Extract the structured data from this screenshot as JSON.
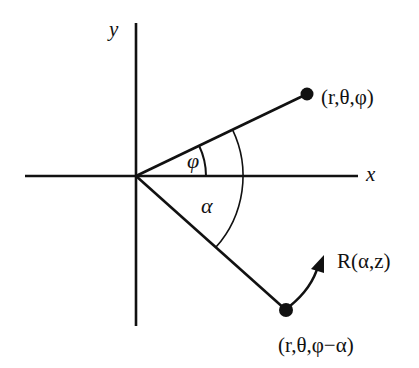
{
  "diagram": {
    "title": "",
    "axes": {
      "x_label": "x",
      "y_label": "y"
    },
    "angles": {
      "phi_label": "φ",
      "alpha_label": "α"
    },
    "points": [
      {
        "id": "original",
        "label": "(r,θ,φ)"
      },
      {
        "id": "rotated",
        "label": "(r,θ,φ−α)"
      }
    ],
    "rotation": {
      "label": "R(α,z)"
    },
    "colors": {
      "ink": "#111111",
      "background": "#ffffff"
    }
  }
}
